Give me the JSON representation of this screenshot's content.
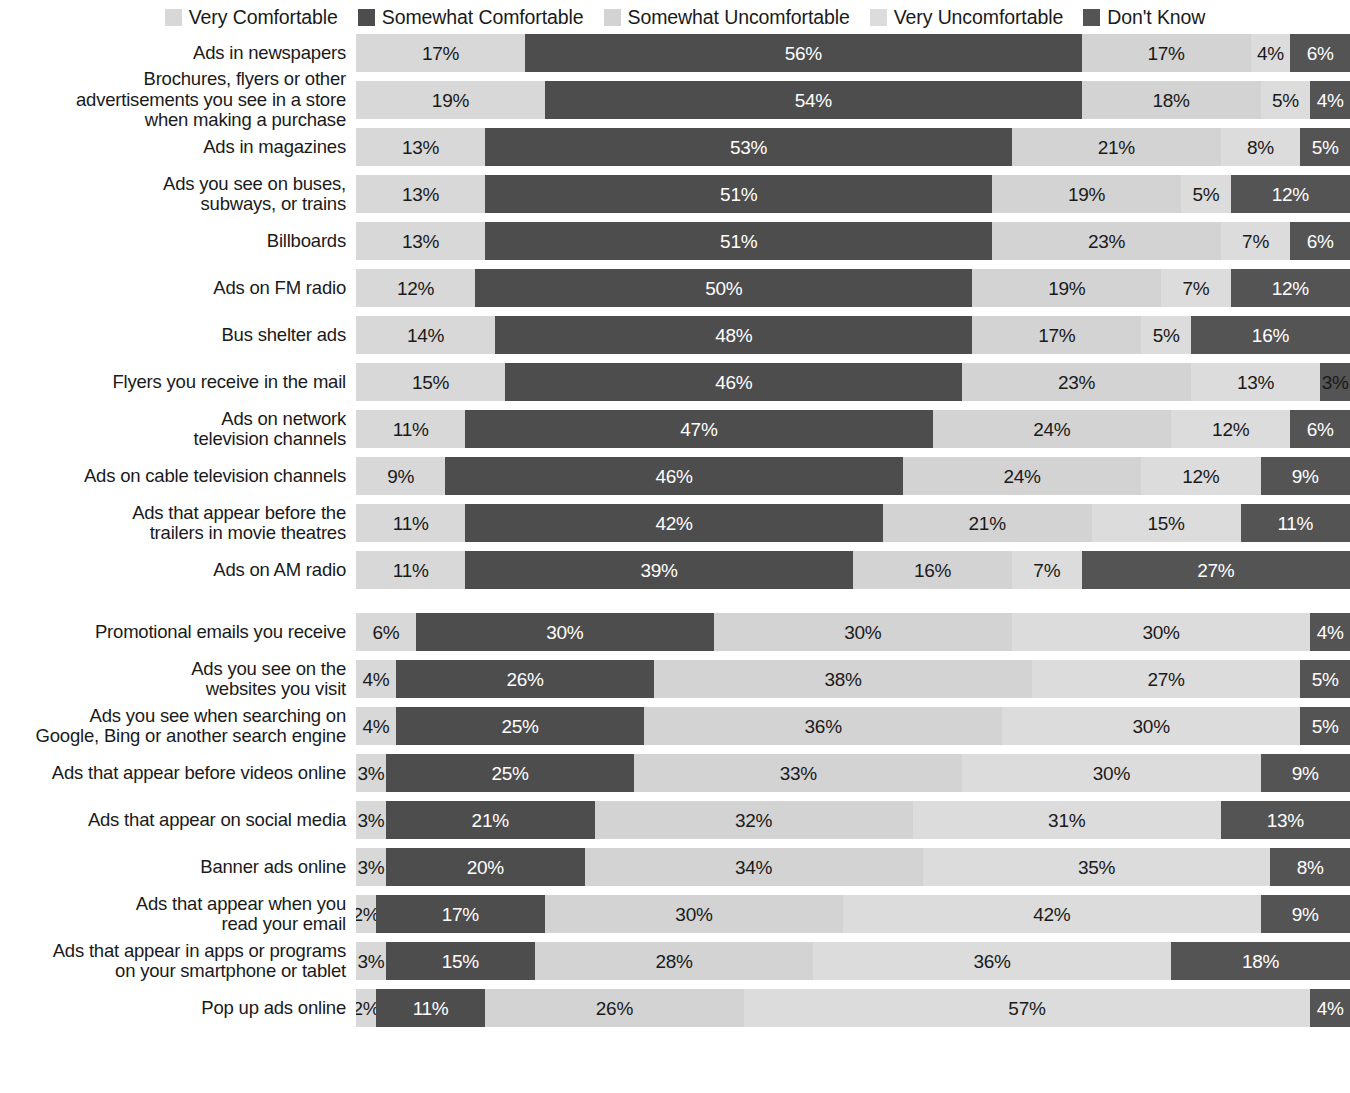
{
  "legend": {
    "position": "top-center",
    "items": [
      {
        "label": "Very Comfortable",
        "color": "#d8d8d8",
        "key": "very_comfortable"
      },
      {
        "label": "Somewhat Comfortable",
        "color": "#4d4d4d",
        "key": "somewhat_comfortable"
      },
      {
        "label": "Somewhat Uncomfortable",
        "color": "#d3d3d3",
        "key": "somewhat_uncomfortable"
      },
      {
        "label": "Very Uncomfortable",
        "color": "#dcdcdc",
        "key": "very_uncomfortable"
      },
      {
        "label": "Don't Know",
        "color": "#545454",
        "key": "dont_know"
      }
    ]
  },
  "chart_data": {
    "type": "bar",
    "subtype": "stacked-horizontal-100",
    "title": "",
    "subtitle": "",
    "xlabel": "",
    "ylabel": "",
    "xlim": [
      0,
      100
    ],
    "grid": false,
    "legend_position": "top-center",
    "value_suffix": "%",
    "series": [
      {
        "name": "Very Comfortable",
        "color": "#d8d8d8",
        "text": "dark",
        "values": [
          17,
          19,
          13,
          13,
          13,
          12,
          14,
          15,
          11,
          9,
          11,
          11,
          6,
          4,
          4,
          3,
          3,
          3,
          2,
          3,
          2
        ]
      },
      {
        "name": "Somewhat Comfortable",
        "color": "#4d4d4d",
        "text": "light",
        "values": [
          56,
          54,
          53,
          51,
          51,
          50,
          48,
          46,
          47,
          46,
          42,
          39,
          30,
          26,
          25,
          25,
          21,
          20,
          17,
          15,
          11
        ]
      },
      {
        "name": "Somewhat Uncomfortable",
        "color": "#d3d3d3",
        "text": "dark",
        "values": [
          17,
          18,
          21,
          19,
          23,
          19,
          17,
          23,
          24,
          24,
          21,
          16,
          30,
          38,
          36,
          33,
          32,
          34,
          30,
          28,
          26
        ]
      },
      {
        "name": "Very Uncomfortable",
        "color": "#dcdcdc",
        "text": "dark",
        "values": [
          4,
          5,
          8,
          5,
          7,
          7,
          5,
          13,
          12,
          12,
          15,
          7,
          30,
          27,
          30,
          30,
          31,
          35,
          42,
          36,
          57
        ]
      },
      {
        "name": "Don't Know",
        "color": "#545454",
        "text": "light",
        "values": [
          6,
          4,
          5,
          12,
          6,
          12,
          16,
          3,
          6,
          9,
          11,
          27,
          4,
          5,
          5,
          9,
          13,
          8,
          9,
          18,
          4
        ]
      }
    ],
    "categories": [
      "Ads in newspapers",
      "Brochures, flyers or other\nadvertisements you see in a store\nwhen making a purchase",
      "Ads in magazines",
      "Ads you see on buses,\nsubways, or trains",
      "Billboards",
      "Ads on FM radio",
      "Bus shelter ads",
      "Flyers you receive in the mail",
      "Ads on network\ntelevision channels",
      "Ads on cable television channels",
      "Ads that appear before the\ntrailers in movie theatres",
      "Ads on AM radio",
      "Promotional emails you receive",
      "Ads you see on the\nwebsites you visit",
      "Ads you see when searching on\nGoogle, Bing or another search engine",
      "Ads that appear before videos online",
      "Ads that appear on social media",
      "Banner ads online",
      "Ads that appear when you\nread your email",
      "Ads that appear in apps or programs\non your smartphone or tablet",
      "Pop up ads online"
    ],
    "group_break_after_index": 11,
    "rows": [
      {
        "label": "Ads in newspapers",
        "values": [
          17,
          56,
          17,
          4,
          6
        ],
        "labels": [
          "17%",
          "56%",
          "17%",
          "4%",
          "6%"
        ]
      },
      {
        "label": "Brochures, flyers or other\nadvertisements you see in a store\nwhen making a purchase",
        "values": [
          19,
          54,
          18,
          5,
          4
        ],
        "labels": [
          "19%",
          "54%",
          "18%",
          "5%",
          "4%"
        ]
      },
      {
        "label": "Ads in magazines",
        "values": [
          13,
          53,
          21,
          8,
          5
        ],
        "labels": [
          "13%",
          "53%",
          "21%",
          "8%",
          "5%"
        ]
      },
      {
        "label": "Ads you see on buses,\nsubways, or trains",
        "values": [
          13,
          51,
          19,
          5,
          12
        ],
        "labels": [
          "13%",
          "51%",
          "19%",
          "5%",
          "12%"
        ]
      },
      {
        "label": "Billboards",
        "values": [
          13,
          51,
          23,
          7,
          6
        ],
        "labels": [
          "13%",
          "51%",
          "23%",
          "7%",
          "6%"
        ]
      },
      {
        "label": "Ads on FM radio",
        "values": [
          12,
          50,
          19,
          7,
          12
        ],
        "labels": [
          "12%",
          "50%",
          "19%",
          "7%",
          "12%"
        ]
      },
      {
        "label": "Bus shelter ads",
        "values": [
          14,
          48,
          17,
          5,
          16
        ],
        "labels": [
          "14%",
          "48%",
          "17%",
          "5%",
          "16%"
        ]
      },
      {
        "label": "Flyers you receive in the mail",
        "values": [
          15,
          46,
          23,
          13,
          3
        ],
        "labels": [
          "15%",
          "46%",
          "23%",
          "13%",
          "3%"
        ]
      },
      {
        "label": "Ads on network\ntelevision channels",
        "values": [
          11,
          47,
          24,
          12,
          6
        ],
        "labels": [
          "11%",
          "47%",
          "24%",
          "12%",
          "6%"
        ]
      },
      {
        "label": "Ads on cable television channels",
        "values": [
          9,
          46,
          24,
          12,
          9
        ],
        "labels": [
          "9%",
          "46%",
          "24%",
          "12%",
          "9%"
        ]
      },
      {
        "label": "Ads that appear before the\ntrailers in movie theatres",
        "values": [
          11,
          42,
          21,
          15,
          11
        ],
        "labels": [
          "11%",
          "42%",
          "21%",
          "15%",
          "11%"
        ]
      },
      {
        "label": "Ads on AM radio",
        "values": [
          11,
          39,
          16,
          7,
          27
        ],
        "labels": [
          "11%",
          "39%",
          "16%",
          "7%",
          "27%"
        ]
      },
      {
        "label": "Promotional emails you receive",
        "values": [
          6,
          30,
          30,
          30,
          4
        ],
        "labels": [
          "6%",
          "30%",
          "30%",
          "30%",
          "4%"
        ]
      },
      {
        "label": "Ads you see on the\nwebsites you visit",
        "values": [
          4,
          26,
          38,
          27,
          5
        ],
        "labels": [
          "4%",
          "26%",
          "38%",
          "27%",
          "5%"
        ]
      },
      {
        "label": "Ads you see when searching on\nGoogle, Bing or another search engine",
        "values": [
          4,
          25,
          36,
          30,
          5
        ],
        "labels": [
          "4%",
          "25%",
          "36%",
          "30%",
          "5%"
        ]
      },
      {
        "label": "Ads that appear before videos online",
        "values": [
          3,
          25,
          33,
          30,
          9
        ],
        "labels": [
          "3%",
          "25%",
          "33%",
          "30%",
          "9%"
        ]
      },
      {
        "label": "Ads that appear on social media",
        "values": [
          3,
          21,
          32,
          31,
          13
        ],
        "labels": [
          "3%",
          "21%",
          "32%",
          "31%",
          "13%"
        ]
      },
      {
        "label": "Banner ads online",
        "values": [
          3,
          20,
          34,
          35,
          8
        ],
        "labels": [
          "3%",
          "20%",
          "34%",
          "35%",
          "8%"
        ]
      },
      {
        "label": "Ads that appear when you\nread your email",
        "values": [
          2,
          17,
          30,
          42,
          9
        ],
        "labels": [
          "2%",
          "17%",
          "30%",
          "42%",
          "9%"
        ]
      },
      {
        "label": "Ads that appear in apps or programs\non your smartphone or tablet",
        "values": [
          3,
          15,
          28,
          36,
          18
        ],
        "labels": [
          "3%",
          "15%",
          "28%",
          "36%",
          "18%"
        ]
      },
      {
        "label": "Pop up ads online",
        "values": [
          2,
          11,
          26,
          57,
          4
        ],
        "labels": [
          "2%",
          "11%",
          "26%",
          "57%",
          "4%"
        ]
      }
    ]
  }
}
